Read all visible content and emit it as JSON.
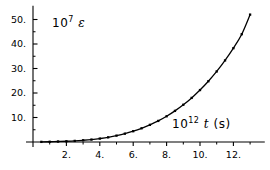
{
  "chart_data": {
    "type": "line",
    "title": "",
    "subtitle": "",
    "xlabel": "10^12 t (s)",
    "ylabel": "10^7 e",
    "xlabel_parts": {
      "base": "10",
      "exponent": "12",
      "variable": "t",
      "unit": "(s)"
    },
    "ylabel_parts": {
      "base": "10",
      "exponent": "7",
      "variable": "ε",
      "unit": ""
    },
    "xlim": [
      0,
      13.4
    ],
    "ylim": [
      0,
      54
    ],
    "grid": false,
    "legend": null,
    "marker": "square",
    "line_color": "#000000",
    "marker_color": "#000000",
    "background": "#ffffff",
    "xticks": [
      2,
      4,
      6,
      8,
      10,
      12
    ],
    "xtick_labels": [
      "2.",
      "4.",
      "6.",
      "8.",
      "10.",
      "12."
    ],
    "xminor_ticks": [
      1,
      3,
      5,
      7,
      9,
      11,
      13
    ],
    "yticks": [
      10,
      20,
      30,
      40,
      50
    ],
    "ytick_labels": [
      "10.",
      "20.",
      "30.",
      "40.",
      "50."
    ],
    "yminor_ticks": [
      5,
      15,
      25,
      35,
      45
    ],
    "x": [
      0.5,
      1.0,
      1.5,
      2.0,
      2.5,
      3.0,
      3.5,
      4.0,
      4.5,
      5.0,
      5.5,
      6.0,
      6.5,
      7.0,
      7.5,
      8.0,
      8.5,
      9.0,
      9.5,
      10.0,
      10.5,
      11.0,
      11.5,
      12.0,
      12.5,
      13.0
    ],
    "y": [
      0.05,
      0.1,
      0.2,
      0.3,
      0.45,
      0.7,
      1.0,
      1.4,
      1.9,
      2.6,
      3.4,
      4.4,
      5.6,
      7.0,
      8.6,
      10.5,
      12.7,
      15.2,
      18.0,
      21.2,
      24.8,
      28.8,
      33.3,
      38.3,
      44.0,
      52.0
    ]
  },
  "meta": {
    "plot_name": "strain-vs-time-plot"
  }
}
